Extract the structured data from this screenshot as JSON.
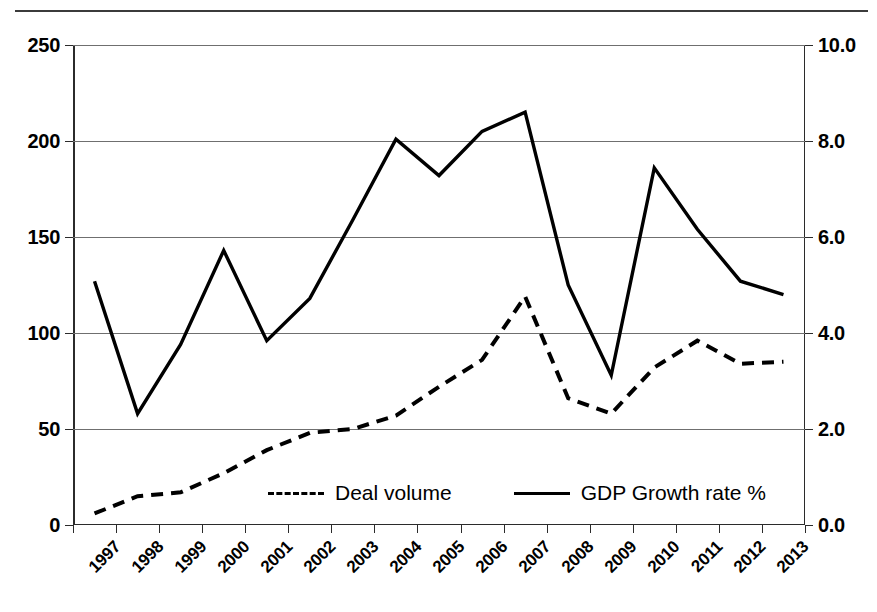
{
  "chart_data": {
    "type": "line",
    "title": "",
    "subtitle": "",
    "xlabel": "",
    "ylabel": "",
    "grid": true,
    "legend_position": "inside-bottom-center",
    "categories": [
      "1997",
      "1998",
      "1999",
      "2000",
      "2001",
      "2002",
      "2003",
      "2004",
      "2005",
      "2006",
      "2007",
      "2008",
      "2009",
      "2010",
      "2011",
      "2012",
      "2013"
    ],
    "axes": {
      "left": {
        "label": "",
        "ticks": [
          "0",
          "50",
          "100",
          "150",
          "200",
          "250"
        ],
        "tick_values": [
          0,
          50,
          100,
          150,
          200,
          250
        ],
        "min": 0,
        "max": 250
      },
      "right": {
        "label": "",
        "ticks": [
          "0.0",
          "2.0",
          "4.0",
          "6.0",
          "8.0",
          "10.0"
        ],
        "tick_values": [
          0.0,
          2.0,
          4.0,
          6.0,
          8.0,
          10.0
        ],
        "min": 0.0,
        "max": 10.0
      }
    },
    "series": [
      {
        "name": "Deal volume",
        "axis": "left",
        "style": "dashed",
        "color": "#000000",
        "values": [
          6,
          15,
          17,
          27,
          39,
          48,
          50,
          57,
          72,
          86,
          119,
          66,
          58,
          82,
          96,
          84,
          85
        ]
      },
      {
        "name": "GDP Growth rate %",
        "axis": "right",
        "style": "solid",
        "color": "#000000",
        "values": [
          5.08,
          2.32,
          3.76,
          5.72,
          3.84,
          4.72,
          6.36,
          8.04,
          7.28,
          8.2,
          8.6,
          5.0,
          3.12,
          7.44,
          6.16,
          5.08,
          4.8
        ],
        "values_left_scale": [
          127,
          58,
          94,
          143,
          96,
          118,
          159,
          201,
          182,
          205,
          215,
          125,
          78,
          186,
          154,
          127,
          120
        ]
      }
    ],
    "legend": [
      {
        "label": "Deal volume",
        "style": "dashed"
      },
      {
        "label": "GDP Growth rate %",
        "style": "solid"
      }
    ]
  }
}
